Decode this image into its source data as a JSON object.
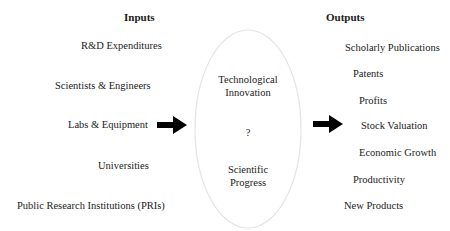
{
  "inputs": {
    "header": "Inputs",
    "items": [
      "R&D Expenditures",
      "Scientists & Engineers",
      "Labs & Equipment",
      "Universities",
      "Public Research Institutions (PRIs)"
    ]
  },
  "process": {
    "top": [
      "Technological",
      "Innovation"
    ],
    "middle": "?",
    "bottom": [
      "Scientific",
      "Progress"
    ]
  },
  "outputs": {
    "header": "Outputs",
    "items": [
      "Scholarly Publications",
      "Patents",
      "Profits",
      "Stock Valuation",
      "Economic Growth",
      "Productivity",
      "New Products"
    ]
  },
  "icons": {
    "input_arrow": "right-arrow",
    "output_arrow": "right-arrow"
  },
  "colors": {
    "text": "#1a1a1a",
    "arrow": "#000000",
    "ellipse_stroke": "#e4e4e4"
  }
}
